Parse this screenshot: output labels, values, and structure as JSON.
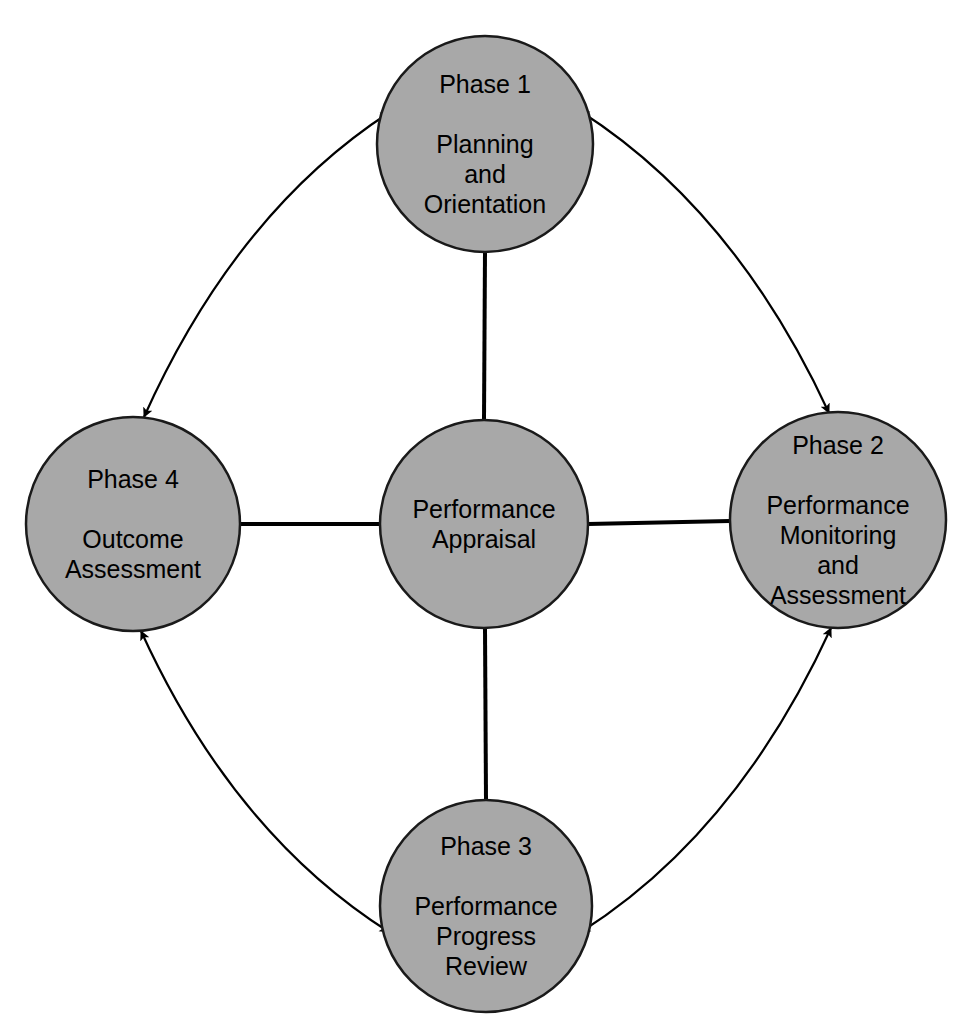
{
  "diagram": {
    "type": "cycle-diagram",
    "colors": {
      "node_fill": "#a8a8a8",
      "node_stroke": "#1a1a1a",
      "connector": "#000000",
      "text": "#000000",
      "background": "#ffffff"
    },
    "center": {
      "id": "performance-appraisal",
      "phase": "",
      "lines": [
        "Performance",
        "Appraisal"
      ],
      "cx": 484,
      "cy": 524,
      "r": 104
    },
    "nodes": [
      {
        "id": "phase-1",
        "phase": "Phase 1",
        "lines": [
          "Planning",
          "and",
          "Orientation"
        ],
        "position": "top",
        "cx": 485,
        "cy": 144,
        "r": 108
      },
      {
        "id": "phase-2",
        "phase": "Phase 2",
        "lines": [
          "Performance",
          "Monitoring",
          "and",
          "Assessment"
        ],
        "position": "right",
        "cx": 838,
        "cy": 520,
        "r": 108
      },
      {
        "id": "phase-3",
        "phase": "Phase 3",
        "lines": [
          "Performance",
          "Progress",
          "Review"
        ],
        "position": "bottom",
        "cx": 486,
        "cy": 906,
        "r": 106
      },
      {
        "id": "phase-4",
        "phase": "Phase 4",
        "lines": [
          "Outcome",
          "Assessment"
        ],
        "position": "left",
        "cx": 133,
        "cy": 524,
        "r": 107
      }
    ],
    "spokes": [
      {
        "id": "spoke-center-to-phase-1",
        "from": "performance-appraisal",
        "to": "phase-1",
        "style": "solid-line",
        "arrowheads": "none"
      },
      {
        "id": "spoke-center-to-phase-2",
        "from": "performance-appraisal",
        "to": "phase-2",
        "style": "solid-line",
        "arrowheads": "none"
      },
      {
        "id": "spoke-center-to-phase-3",
        "from": "performance-appraisal",
        "to": "phase-3",
        "style": "solid-line",
        "arrowheads": "none"
      },
      {
        "id": "spoke-center-to-phase-4",
        "from": "performance-appraisal",
        "to": "phase-4",
        "style": "solid-line",
        "arrowheads": "none"
      }
    ],
    "arcs": [
      {
        "id": "arc-phase-4-phase-1",
        "between": [
          "phase-4",
          "phase-1"
        ],
        "quadrant": "top-left",
        "arrowheads": "both"
      },
      {
        "id": "arc-phase-1-phase-2",
        "between": [
          "phase-1",
          "phase-2"
        ],
        "quadrant": "top-right",
        "arrowheads": "both"
      },
      {
        "id": "arc-phase-2-phase-3",
        "between": [
          "phase-2",
          "phase-3"
        ],
        "quadrant": "bottom-right",
        "arrowheads": "both"
      },
      {
        "id": "arc-phase-3-phase-4",
        "between": [
          "phase-3",
          "phase-4"
        ],
        "quadrant": "bottom-left",
        "arrowheads": "both"
      }
    ]
  }
}
